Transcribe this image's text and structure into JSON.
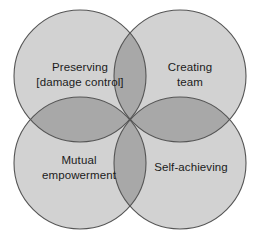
{
  "diagram": {
    "type": "four-circle-venn",
    "background_color": "#ffffff",
    "circle_fill": "#d2d2d2",
    "circle_overlap_fill": "#a8a8a8",
    "circle_stroke": "#555555",
    "label_color": "#1b1b1b",
    "circles": [
      {
        "id": "preserving",
        "position": "top-left",
        "cx": 80,
        "cy": 76,
        "r": 66,
        "label": "Preserving\n[damage control]"
      },
      {
        "id": "creating-team",
        "position": "top-right",
        "cx": 180,
        "cy": 76,
        "r": 66,
        "label": "Creating\nteam"
      },
      {
        "id": "mutual-empowerment",
        "position": "bottom-left",
        "cx": 80,
        "cy": 163,
        "r": 66,
        "label": "Mutual\nempowerment"
      },
      {
        "id": "self-achieving",
        "position": "bottom-right",
        "cx": 180,
        "cy": 163,
        "r": 66,
        "label": "Self-achieving"
      }
    ]
  }
}
